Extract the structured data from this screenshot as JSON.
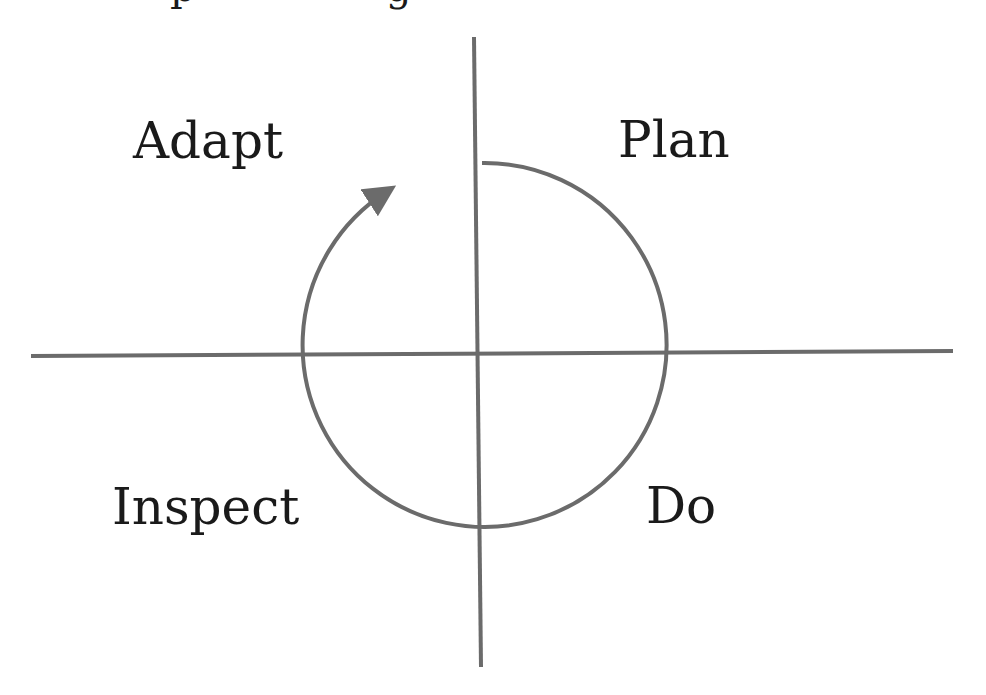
{
  "diagram": {
    "type": "cycle-quadrant",
    "top_clipped_caption": "...p...g...",
    "quadrants": {
      "top_left": "Adapt",
      "top_right": "Plan",
      "bottom_left": "Inspect",
      "bottom_right": "Do"
    },
    "cycle_direction": "clockwise",
    "colors": {
      "line": "#6b6b6b",
      "text": "#1a1a1a",
      "background": "#ffffff"
    }
  }
}
